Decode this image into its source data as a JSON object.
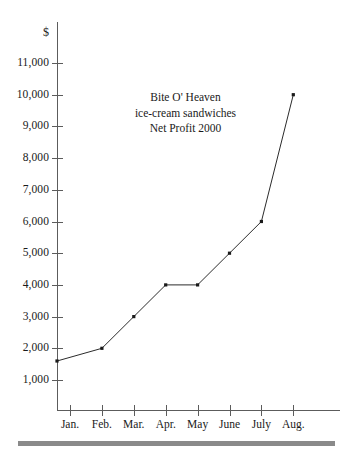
{
  "chart_data": {
    "type": "line",
    "title": "Bite O' Heaven ice-cream sandwiches Net Profit 2000",
    "title_lines": [
      "Bite O' Heaven",
      "ice-cream sandwiches",
      "Net Profit 2000"
    ],
    "xlabel": "",
    "ylabel": "",
    "unit_label": "$",
    "categories": [
      "Jan.",
      "Feb.",
      "Mar.",
      "Apr.",
      "May",
      "June",
      "July",
      "Aug."
    ],
    "values": [
      1600,
      2000,
      3000,
      4000,
      4000,
      5000,
      6000,
      10000
    ],
    "ylim": [
      0,
      11500
    ],
    "ytick_values": [
      1000,
      2000,
      3000,
      4000,
      5000,
      6000,
      7000,
      8000,
      9000,
      10000,
      11000
    ],
    "ytick_labels": [
      "1,000",
      "2,000",
      "3,000",
      "4,000",
      "5,000",
      "6,000",
      "7,000",
      "8,000",
      "9,000",
      "10,000",
      "11,000"
    ],
    "grid": false,
    "legend": false,
    "legend_position": "none",
    "series": [
      {
        "name": "Net Profit",
        "values": [
          1600,
          2000,
          3000,
          4000,
          4000,
          5000,
          6000,
          10000
        ]
      }
    ],
    "colors": {
      "line": "#2b2b2b",
      "marker": "#1a1a1a",
      "axis": "#5c5c5c",
      "text": "#1a1a1a",
      "rule": "#8a8a8a",
      "background": "#ffffff"
    }
  },
  "axis": {
    "y_ticks": [
      {
        "label": "11,000",
        "value": 11000
      },
      {
        "label": "10,000",
        "value": 10000
      },
      {
        "label": "9,000",
        "value": 9000
      },
      {
        "label": "8,000",
        "value": 8000
      },
      {
        "label": "7,000",
        "value": 7000
      },
      {
        "label": "6,000",
        "value": 6000
      },
      {
        "label": "5,000",
        "value": 5000
      },
      {
        "label": "4,000",
        "value": 4000
      },
      {
        "label": "3,000",
        "value": 3000
      },
      {
        "label": "2,000",
        "value": 2000
      },
      {
        "label": "1,000",
        "value": 1000
      }
    ],
    "x_ticks": [
      {
        "label": "Jan."
      },
      {
        "label": "Feb."
      },
      {
        "label": "Mar."
      },
      {
        "label": "Apr."
      },
      {
        "label": "May"
      },
      {
        "label": "June"
      },
      {
        "label": "July"
      },
      {
        "label": "Aug."
      }
    ],
    "unit": "$"
  },
  "annotation": {
    "line1": "Bite O' Heaven",
    "line2": "ice-cream sandwiches",
    "line3": "Net Profit 2000"
  }
}
